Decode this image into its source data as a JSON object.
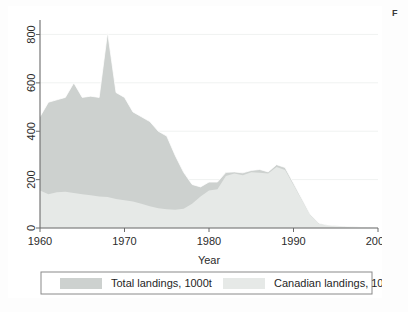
{
  "figure": {
    "caption_fragment": "F",
    "background_color": "#ffffff"
  },
  "chart_data": {
    "type": "area",
    "title": "",
    "subtitle": "",
    "xlabel": "Year",
    "ylabel": "",
    "xlim": [
      1960,
      2000
    ],
    "ylim": [
      0,
      860
    ],
    "grid": true,
    "grid_orientation": "horizontal",
    "legend_position": "bottom",
    "x_ticks": [
      1960,
      1970,
      1980,
      1990,
      2000
    ],
    "x_tick_labels": [
      "1960",
      "1970",
      "1980",
      "1990",
      "2000"
    ],
    "y_ticks": [
      0,
      200,
      400,
      600,
      800
    ],
    "y_tick_labels": [
      "0",
      "200",
      "400",
      "600",
      "800"
    ],
    "y_tick_rotated": true,
    "colors": {
      "total": "#cdd1cf",
      "canadian": "#e6e9e7",
      "axis": "#6b6b6b",
      "grid": "#f2f4f3",
      "text": "#2b2b2b"
    },
    "x": [
      1960,
      1961,
      1962,
      1963,
      1964,
      1965,
      1966,
      1967,
      1968,
      1969,
      1970,
      1971,
      1972,
      1973,
      1974,
      1975,
      1976,
      1977,
      1978,
      1979,
      1980,
      1981,
      1982,
      1983,
      1984,
      1985,
      1986,
      1987,
      1988,
      1989,
      1990,
      1991,
      1992,
      1993,
      1994,
      1995,
      1996,
      1997,
      1998,
      1999,
      2000
    ],
    "series": [
      {
        "name": "Total landings, 1000t",
        "label": "Total landings, 1000t",
        "color": "#cdd1cf",
        "values": [
          460,
          520,
          530,
          540,
          600,
          540,
          545,
          540,
          810,
          560,
          540,
          480,
          460,
          440,
          400,
          380,
          300,
          230,
          180,
          170,
          190,
          190,
          230,
          232,
          228,
          238,
          242,
          232,
          262,
          250,
          185,
          120,
          55,
          20,
          12,
          9,
          7,
          5,
          4,
          3,
          2
        ]
      },
      {
        "name": "Canadian landings, 1000t",
        "label": "Canadian landings, 1000t",
        "color": "#e6e9e7",
        "values": [
          155,
          140,
          148,
          150,
          145,
          140,
          135,
          130,
          128,
          120,
          115,
          110,
          100,
          90,
          82,
          78,
          75,
          80,
          100,
          130,
          155,
          160,
          215,
          225,
          218,
          230,
          228,
          225,
          252,
          240,
          178,
          115,
          52,
          18,
          11,
          8,
          6,
          5,
          4,
          3,
          2
        ]
      }
    ],
    "annotations": [
      {
        "text": "peak 810 in 1968",
        "x": 1968,
        "y": 810
      },
      {
        "text": "collapse after 1990",
        "x": 1992,
        "y": 55
      }
    ]
  },
  "legend": {
    "items": [
      {
        "label": "Total landings, 1000t",
        "swatch_color": "#cdd1cf"
      },
      {
        "label": "Canadian landings, 1000t",
        "swatch_color": "#e6e9e7"
      }
    ]
  }
}
